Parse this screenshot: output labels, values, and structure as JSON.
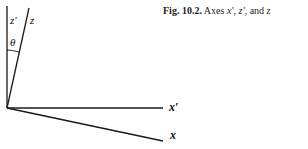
{
  "caption": {
    "figure_label": "Fig. 10.2.",
    "text_prefix": "Axes",
    "axis1": "x′",
    "sep1": ",",
    "axis2": "z′",
    "sep2": ", and",
    "axis3": "z"
  },
  "labels": {
    "z_prime": "z′",
    "z": "z",
    "theta": "θ",
    "x_prime": "x′",
    "x": "x"
  },
  "colors": {
    "line": "#1a1a1a",
    "background": "#ffffff"
  }
}
